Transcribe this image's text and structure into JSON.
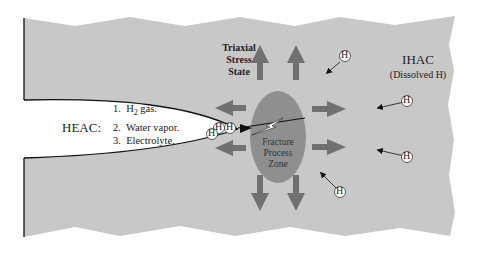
{
  "diagram": {
    "colors": {
      "material": "#c8c8c8",
      "crack": "#ffffff",
      "outline": "#111111",
      "zone": "#8f8f8f",
      "stress_arrow": "#707070",
      "h_arrow": "#111111",
      "text": "#222222"
    },
    "heac": {
      "label": "HEAC:",
      "sources": [
        {
          "num": "1.",
          "text": "H",
          "sub": "2",
          "suffix": " gas."
        },
        {
          "num": "2.",
          "text": "Water vapor."
        },
        {
          "num": "3.",
          "text": "Electrolyte."
        }
      ]
    },
    "stress": {
      "lines": [
        "Triaxial",
        "Stress",
        "State"
      ]
    },
    "ihac": {
      "title": "IHAC",
      "subtitle": "(Dissolved H)"
    },
    "zone": {
      "lines": [
        "Fracture",
        "Process",
        "Zone"
      ]
    },
    "hydrogen_symbol": "H"
  }
}
